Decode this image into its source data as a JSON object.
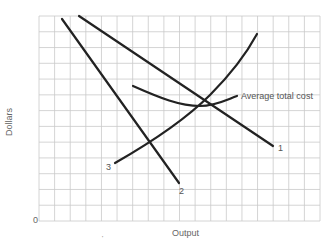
{
  "chart_data": {
    "type": "line",
    "title": "",
    "xlabel": "Output",
    "ylabel": "Dollars",
    "origin_label": "0",
    "grid": true,
    "grid_columns": 18,
    "grid_rows": 13,
    "x_range": [
      0,
      18
    ],
    "y_range": [
      0,
      13
    ],
    "legend": "none (inline labels)",
    "series": [
      {
        "name": "1",
        "kind": "straight line, downward sloping (shallower)",
        "points": [
          [
            2.6,
            13.0
          ],
          [
            15.0,
            4.8
          ]
        ]
      },
      {
        "name": "2",
        "kind": "straight line, downward sloping (steeper)",
        "points": [
          [
            1.5,
            12.8
          ],
          [
            8.97,
            2.4
          ]
        ]
      },
      {
        "name": "3",
        "kind": "upward sloping convex curve",
        "points": [
          [
            4.9,
            3.7
          ],
          [
            7.0,
            5.0
          ],
          [
            9.5,
            6.9
          ],
          [
            11.5,
            8.9
          ],
          [
            13.9,
            11.7
          ]
        ]
      },
      {
        "name": "Average total cost",
        "kind": "U-shaped curve",
        "points": [
          [
            6.0,
            8.5
          ],
          [
            8.0,
            7.8
          ],
          [
            10.3,
            7.3
          ],
          [
            12.0,
            7.6
          ],
          [
            12.7,
            7.9
          ]
        ]
      }
    ],
    "annotations": [
      {
        "text": "1",
        "at": "end of line 1 (lower right)"
      },
      {
        "text": "2",
        "at": "end of line 2 (bottom)"
      },
      {
        "text": "3",
        "at": "start of curve 3 (lower left)"
      },
      {
        "text": "Average total cost",
        "at": "right end of U-shaped curve"
      }
    ]
  },
  "labels": {
    "ylabel": "Dollars",
    "xlabel": "Output",
    "origin": "0",
    "line1": "1",
    "line2": "2",
    "line3": "3",
    "atc": "Average total cost",
    "tick_mark": "'"
  }
}
